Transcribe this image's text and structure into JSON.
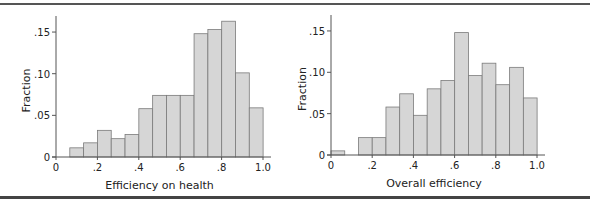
{
  "chart_data": [
    {
      "type": "bar",
      "title": "",
      "xlabel": "Efficiency on health",
      "ylabel": "Fraction",
      "xlim": [
        0,
        1.0
      ],
      "ylim": [
        0,
        0.165
      ],
      "xticks": [
        "0",
        ".2",
        ".4",
        ".6",
        ".8",
        "1.0"
      ],
      "yticks": [
        "0",
        ".05",
        ".10",
        ".15"
      ],
      "grid": false,
      "bin_width": 0.0667,
      "bin_start": 0.0667,
      "categories": [
        "0.07-0.13",
        "0.13-0.20",
        "0.20-0.27",
        "0.27-0.33",
        "0.33-0.40",
        "0.40-0.47",
        "0.47-0.53",
        "0.53-0.60",
        "0.60-0.67",
        "0.67-0.73",
        "0.73-0.80",
        "0.80-0.87",
        "0.87-0.93",
        "0.93-1.00"
      ],
      "values": [
        0.011,
        0.017,
        0.032,
        0.022,
        0.027,
        0.058,
        0.074,
        0.074,
        0.074,
        0.148,
        0.153,
        0.163,
        0.101,
        0.059
      ]
    },
    {
      "type": "bar",
      "title": "",
      "xlabel": "Overall efficiency",
      "ylabel": "Fraction",
      "xlim": [
        0,
        1.0
      ],
      "ylim": [
        0,
        0.165
      ],
      "xticks": [
        "0",
        ".2",
        ".4",
        ".6",
        ".8",
        "1.0"
      ],
      "yticks": [
        "0",
        ".05",
        ".10",
        ".15"
      ],
      "grid": false,
      "bin_width": 0.0667,
      "bin_start": 0.0,
      "categories": [
        "0.00-0.07",
        "0.07-0.13",
        "0.13-0.20",
        "0.20-0.27",
        "0.27-0.33",
        "0.33-0.40",
        "0.40-0.47",
        "0.47-0.53",
        "0.53-0.60",
        "0.60-0.67",
        "0.67-0.73",
        "0.73-0.80",
        "0.80-0.87",
        "0.87-0.93",
        "0.93-1.00"
      ],
      "values": [
        0.005,
        0.0,
        0.021,
        0.021,
        0.058,
        0.074,
        0.048,
        0.08,
        0.09,
        0.148,
        0.096,
        0.111,
        0.085,
        0.106,
        0.069
      ]
    }
  ],
  "colors": {
    "bar_fill": "#d6d6d6",
    "bar_stroke": "#7a7a7a",
    "axis": "#555555"
  }
}
